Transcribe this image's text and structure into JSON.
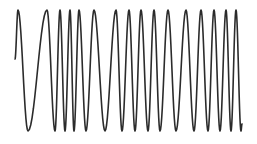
{
  "chart_data": {
    "type": "line",
    "title": "",
    "xlabel": "",
    "ylabel": "",
    "grid": false,
    "legend": null,
    "stroke_color": "#2b2b2b",
    "background_color": "#ffffff",
    "start_point": [
      15,
      59
    ],
    "end_point": [
      242,
      124
    ],
    "extrema": [
      {
        "x": 18,
        "y": 10,
        "kind": "peak"
      },
      {
        "x": 28,
        "y": 131,
        "kind": "trough"
      },
      {
        "x": 47,
        "y": 10,
        "kind": "peak"
      },
      {
        "x": 55,
        "y": 131,
        "kind": "trough"
      },
      {
        "x": 60,
        "y": 10,
        "kind": "peak"
      },
      {
        "x": 65,
        "y": 131,
        "kind": "trough"
      },
      {
        "x": 70,
        "y": 10,
        "kind": "peak"
      },
      {
        "x": 74,
        "y": 131,
        "kind": "trough"
      },
      {
        "x": 79,
        "y": 10,
        "kind": "peak"
      },
      {
        "x": 86,
        "y": 131,
        "kind": "trough"
      },
      {
        "x": 94,
        "y": 10,
        "kind": "peak"
      },
      {
        "x": 105,
        "y": 131,
        "kind": "trough"
      },
      {
        "x": 116,
        "y": 10,
        "kind": "peak"
      },
      {
        "x": 122,
        "y": 131,
        "kind": "trough"
      },
      {
        "x": 129,
        "y": 10,
        "kind": "peak"
      },
      {
        "x": 135,
        "y": 131,
        "kind": "trough"
      },
      {
        "x": 141,
        "y": 10,
        "kind": "peak"
      },
      {
        "x": 148,
        "y": 131,
        "kind": "trough"
      },
      {
        "x": 154,
        "y": 10,
        "kind": "peak"
      },
      {
        "x": 160,
        "y": 131,
        "kind": "trough"
      },
      {
        "x": 168,
        "y": 10,
        "kind": "peak"
      },
      {
        "x": 176,
        "y": 131,
        "kind": "trough"
      },
      {
        "x": 186,
        "y": 10,
        "kind": "peak"
      },
      {
        "x": 194,
        "y": 131,
        "kind": "trough"
      },
      {
        "x": 201,
        "y": 10,
        "kind": "peak"
      },
      {
        "x": 208,
        "y": 131,
        "kind": "trough"
      },
      {
        "x": 214,
        "y": 10,
        "kind": "peak"
      },
      {
        "x": 220,
        "y": 131,
        "kind": "trough"
      },
      {
        "x": 226,
        "y": 10,
        "kind": "peak"
      },
      {
        "x": 231,
        "y": 131,
        "kind": "trough"
      },
      {
        "x": 236,
        "y": 10,
        "kind": "peak"
      },
      {
        "x": 241,
        "y": 131,
        "kind": "trough"
      }
    ],
    "peak_count": 16,
    "trough_count": 16
  }
}
